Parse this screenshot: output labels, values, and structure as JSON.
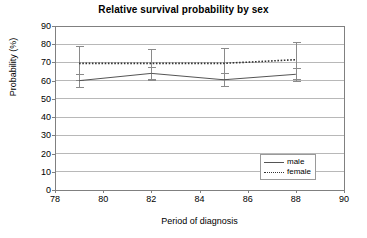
{
  "chart_data": {
    "type": "line",
    "title": "Relative survival probability by sex",
    "xlabel": "Period of diagnosis",
    "ylabel": "Probability (%)",
    "xlim": [
      78,
      90
    ],
    "ylim": [
      0,
      90
    ],
    "xticks": [
      78,
      80,
      82,
      84,
      86,
      88,
      90
    ],
    "yticks": [
      0,
      10,
      20,
      30,
      40,
      50,
      60,
      70,
      80,
      90
    ],
    "grid": "horizontal",
    "legend_position": "lower-right",
    "x": [
      79,
      82,
      85,
      88
    ],
    "series": [
      {
        "name": "male",
        "style": "solid",
        "color": "#555555",
        "values": [
          60,
          64,
          60.5,
          63.5
        ],
        "error_low": [
          56.5,
          60.5,
          57,
          60
        ],
        "error_high": [
          63.5,
          67.5,
          64,
          67
        ]
      },
      {
        "name": "female",
        "style": "dotted",
        "color": "#333333",
        "values": [
          69.5,
          69.5,
          69.5,
          71.5
        ],
        "error_low": [
          60.5,
          61,
          61,
          61
        ],
        "error_high": [
          79,
          77.5,
          78,
          81
        ]
      }
    ]
  },
  "legend": {
    "items": [
      {
        "label": "male",
        "style": "solid"
      },
      {
        "label": "female",
        "style": "dotted"
      }
    ]
  }
}
